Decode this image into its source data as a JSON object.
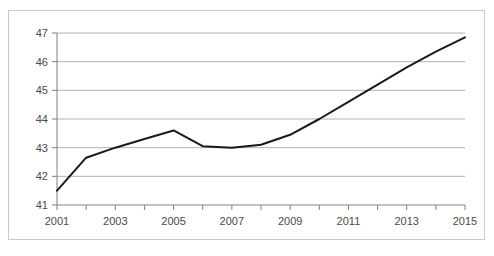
{
  "chart_data": {
    "type": "line",
    "title": "",
    "subtitle": "",
    "xlabel": "",
    "ylabel": "",
    "x": [
      2001,
      2002,
      2003,
      2004,
      2005,
      2006,
      2007,
      2008,
      2009,
      2010,
      2011,
      2012,
      2013,
      2014,
      2015
    ],
    "values": [
      41.5,
      42.65,
      43.0,
      43.3,
      43.6,
      43.05,
      43.0,
      43.1,
      43.45,
      44.0,
      44.6,
      45.2,
      45.8,
      46.35,
      46.85
    ],
    "series": [
      {
        "name": "",
        "color": "#1a1a1a",
        "values": [
          41.5,
          42.65,
          43.0,
          43.3,
          43.6,
          43.05,
          43.0,
          43.1,
          43.45,
          44.0,
          44.6,
          45.2,
          45.8,
          46.35,
          46.85
        ]
      }
    ],
    "xlim": [
      2001,
      2015
    ],
    "ylim": [
      41,
      47
    ],
    "ytick_labels": [
      "41",
      "42",
      "43",
      "44",
      "45",
      "46",
      "47"
    ],
    "ytick_values": [
      41,
      42,
      43,
      44,
      45,
      46,
      47
    ],
    "xtick_values": [
      2001,
      2002,
      2003,
      2004,
      2005,
      2006,
      2007,
      2008,
      2009,
      2010,
      2011,
      2012,
      2013,
      2014,
      2015
    ],
    "xtick_labels": [
      "2001",
      "",
      "2003",
      "",
      "2005",
      "",
      "2007",
      "",
      "2009",
      "",
      "2011",
      "",
      "2013",
      "",
      "2015"
    ],
    "xtick_labels_shown": [
      "2001",
      "2003",
      "2005",
      "2007",
      "2009",
      "2011",
      "2013",
      "2015"
    ],
    "grid": true,
    "grid_axis": "y",
    "grid_color": "#b0b0b0",
    "legend": false,
    "legend_position": "none",
    "axis_color": "#808080",
    "line_color": "#1a1a1a",
    "line_width": 2,
    "background_color": "#ffffff",
    "frame_color": "#c9c9c9",
    "annotations": []
  }
}
